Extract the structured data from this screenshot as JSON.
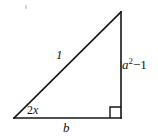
{
  "figure": {
    "type": "right-triangle-diagram",
    "background_color": "#ffffff",
    "stroke_color": "#151515",
    "stroke_width": 1.6,
    "geometry": {
      "vertices": {
        "bottom_left": [
          14,
          118
        ],
        "bottom_right": [
          121,
          118
        ],
        "apex": [
          121,
          12
        ]
      },
      "right_angle_marker": {
        "at": "bottom_right",
        "size": 11
      }
    },
    "labels": {
      "hypotenuse": "1",
      "vertical_leg_base": "a",
      "vertical_leg_exponent": "2",
      "vertical_leg_operator": "−",
      "vertical_leg_term": "1",
      "base": "b",
      "angle_coefficient": "2",
      "angle_variable": "x"
    },
    "artifact": {
      "name": "scan-speck",
      "color": "#c9c9c9"
    }
  }
}
